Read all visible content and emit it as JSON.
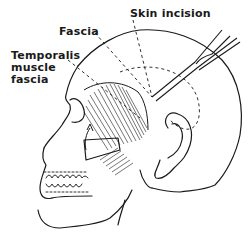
{
  "figure": {
    "labels": {
      "fascia": "Fascia",
      "skin_incision": "Skin incision",
      "temporalis_line1": "Temporalis",
      "temporalis_line2": "muscle",
      "temporalis_line3": "fascia"
    },
    "colors": {
      "ink": "#1a1a1a",
      "background": "#ffffff"
    }
  }
}
